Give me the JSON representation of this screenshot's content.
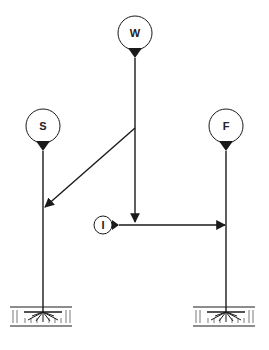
{
  "diagram": {
    "type": "signal-flow network",
    "nodes": [
      {
        "id": "W",
        "label": "W",
        "cx": 135,
        "cy": 33,
        "r": 17
      },
      {
        "id": "S",
        "label": "S",
        "cx": 43,
        "cy": 126,
        "r": 17
      },
      {
        "id": "F",
        "label": "F",
        "cx": 226,
        "cy": 126,
        "r": 17
      },
      {
        "id": "I",
        "label": "I",
        "cx": 103,
        "cy": 225,
        "r": 9
      }
    ],
    "edges": [
      {
        "from": "W",
        "to": "S",
        "description": "W stem branches diagonally at (135,128) to S line at (44,207)"
      },
      {
        "from": "W",
        "to": "I-line",
        "description": "W stem continues down to arrow at (135,222)"
      },
      {
        "from": "I",
        "to": "F",
        "description": "horizontal arrow from I to F line at y=225"
      }
    ],
    "grounds": [
      {
        "attached_to": "S",
        "x": 43,
        "y": 305
      },
      {
        "attached_to": "F",
        "x": 226,
        "y": 305
      }
    ],
    "colors": {
      "stroke": "#1a1a1a",
      "background": "#ffffff"
    }
  }
}
